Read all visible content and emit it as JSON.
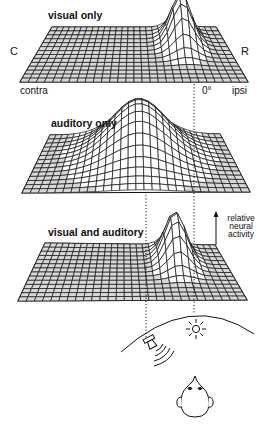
{
  "panels": [
    {
      "id": "visual",
      "title": "visual only",
      "corners": {
        "tl": [
          52,
          27
        ],
        "tr": [
          216,
          27
        ],
        "bl": [
          20,
          82
        ],
        "br": [
          248,
          82
        ]
      },
      "peak": {
        "u": 0.76,
        "v": 0.28,
        "height": 48,
        "sigma_u": 0.055,
        "sigma_v": 0.17
      }
    },
    {
      "id": "auditory",
      "title": "auditory only",
      "corners": {
        "tl": [
          50,
          135
        ],
        "tr": [
          220,
          134
        ],
        "bl": [
          22,
          193
        ],
        "br": [
          250,
          192
        ]
      },
      "peak": {
        "u": 0.52,
        "v": 0.32,
        "height": 52,
        "sigma_u": 0.15,
        "sigma_v": 0.28
      }
    },
    {
      "id": "visual-auditory",
      "title": "visual and auditory",
      "corners": {
        "tl": [
          45,
          243
        ],
        "tr": [
          215,
          245
        ],
        "bl": [
          18,
          301
        ],
        "br": [
          247,
          300
        ]
      },
      "peak": {
        "u": 0.74,
        "v": 0.28,
        "height": 48,
        "sigma_u": 0.055,
        "sigma_v": 0.17
      }
    }
  ],
  "labels": {
    "contralateral_side": "C",
    "rostral_side": "R",
    "contra": "contra",
    "zero_degrees": "0°",
    "ipsi": "ipsi"
  },
  "axis_annotation": {
    "line1": "relative",
    "line2": "neural",
    "line3": "activity"
  },
  "stimuli": {
    "visual_stimulus_x": 194,
    "auditory_stimulus_x": 146,
    "visual_icon": "sun-light-icon",
    "auditory_icon": "speaker-sound-icon",
    "observer_icon": "head-top-view-icon"
  },
  "grid": {
    "cols": 28,
    "rows": 14
  },
  "colors": {
    "ink": "#111111",
    "background": "#ffffff",
    "shade": "#3a3a3a"
  }
}
